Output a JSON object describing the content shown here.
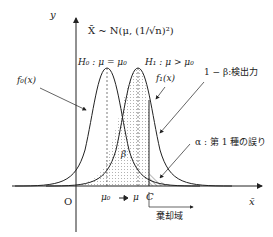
{
  "axes": {
    "y_label": "y",
    "x_label": "x̄",
    "origin_label": "O"
  },
  "distribution": "X̄ ~ N(μ, (1/√n)²)",
  "hypotheses": {
    "h0": "H₀ : μ = μ₀",
    "h1": "H₁ : μ > μ₀"
  },
  "curves": {
    "f0": "f₀(x)",
    "f1": "f₁(x)"
  },
  "annotations": {
    "power": "1 − β:検出力",
    "alpha": "α : 第 1 種の誤り",
    "beta": "β",
    "rejection": "棄却域"
  },
  "ticks": {
    "mu0": "μ₀",
    "mu": "μ",
    "c": "C"
  },
  "colors": {
    "line": "#222222",
    "fill": "#cccccc"
  }
}
